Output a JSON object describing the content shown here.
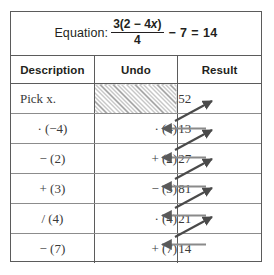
{
  "equation": {
    "label": "Equation:",
    "numerator": "3(2 − 4x)",
    "numerator_prefix": "3(2 − 4",
    "numerator_var": "x",
    "numerator_suffix": ")",
    "denominator": "4",
    "tail": "− 7 = 14",
    "full": "Equation: 3(2 − 4x)/4 − 7 = 14"
  },
  "table": {
    "columns": [
      "Description",
      "Undo",
      "Result"
    ],
    "rows": [
      {
        "description": "Pick x.",
        "undo": "",
        "undo_shaded": true,
        "result": "52"
      },
      {
        "description": "· (−4)",
        "undo": "· (4)",
        "undo_shaded": false,
        "result": "13"
      },
      {
        "description": "− (2)",
        "undo": "+ (2)",
        "undo_shaded": false,
        "result": "27"
      },
      {
        "description": "+ (3)",
        "undo": "− (3)",
        "undo_shaded": false,
        "result": "81"
      },
      {
        "description": "/ (4)",
        "undo": "· (4)",
        "undo_shaded": false,
        "result": "21"
      },
      {
        "description": "− (7)",
        "undo": "+ (7)",
        "undo_shaded": false,
        "result": "14"
      }
    ]
  },
  "arrows": {
    "horizontal_count": 5,
    "diagonal_count": 5,
    "color": "#5a5a5a",
    "note": "horizontal arrows point left from Result into Undo; diagonal arrows point up-right from Undo area of a row into the Result of the row above"
  },
  "colors": {
    "border": "#5b5b5b",
    "inner_rule": "#8c8c8c",
    "text": "#231f20",
    "body_text": "#3a3a3a",
    "hatch": "#8e8e8e",
    "background": "#ffffff"
  }
}
